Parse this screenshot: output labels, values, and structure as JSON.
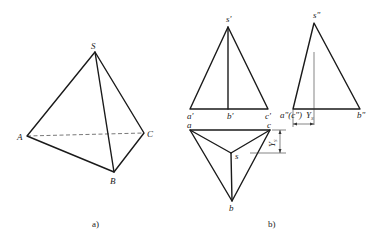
{
  "figure_a": {
    "caption": "a)",
    "labels": {
      "S": "S",
      "A": "A",
      "B": "B",
      "C": "C"
    }
  },
  "figure_b": {
    "caption": "b)",
    "front_view": {
      "s": "s'",
      "a": "a'",
      "b": "b'",
      "c": "c'"
    },
    "side_view": {
      "s": "s\"",
      "ac": "a\"(c\")",
      "b": "b\"",
      "dim": "Y",
      "dim_sub": "S"
    },
    "top_view": {
      "s": "s",
      "a": "a",
      "b": "b",
      "c": "c",
      "dim": "Y",
      "dim_sub": "S"
    }
  },
  "colors": {
    "line": "#1a1a1a",
    "background": "#ffffff"
  }
}
